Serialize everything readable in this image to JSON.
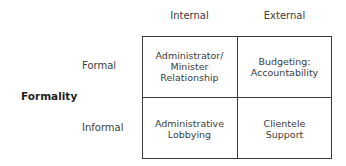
{
  "axis_label": "Formality",
  "columns": [
    "Internal",
    "External"
  ],
  "rows": [
    "Formal",
    "Informal"
  ],
  "cells": {
    "formal_internal": "Administrator/\nMinister\nRelationship",
    "formal_external": "Budgeting:\nAccountability",
    "informal_internal": "Administrative\nLobbying",
    "informal_external": "Clientele\nSupport"
  }
}
